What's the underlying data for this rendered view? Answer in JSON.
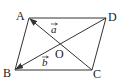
{
  "figure": {
    "type": "parallelogram",
    "vertices": {
      "A": "A",
      "B": "B",
      "C": "C",
      "D": "D"
    },
    "center_label": "O",
    "vectors": [
      {
        "label": "a",
        "from": "C",
        "to": "A"
      },
      {
        "label": "b",
        "from": "D",
        "to": "B"
      }
    ],
    "stroke_color": "#333333"
  }
}
